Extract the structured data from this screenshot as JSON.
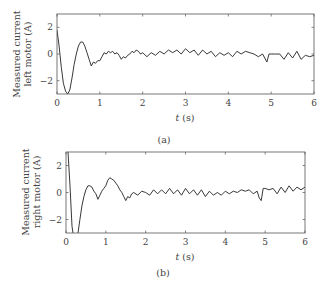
{
  "chart_data": [
    {
      "type": "line",
      "id": "a",
      "caption": "(a)",
      "title": "",
      "xlabel_italic": "t",
      "xlabel_unit": " (s)",
      "ylabel_lines": [
        "Measured current",
        "left motor (A)"
      ],
      "xlim": [
        0,
        6
      ],
      "ylim": [
        -3,
        3
      ],
      "xticks": [
        0,
        1,
        2,
        3,
        4,
        5,
        6
      ],
      "yticks": [
        -2,
        0,
        2
      ],
      "ytick_labels": [
        "−2",
        "0",
        "2"
      ],
      "grid": false,
      "series": [
        {
          "name": "left motor current",
          "color": "#222222",
          "x": [
            0,
            0.05,
            0.1,
            0.15,
            0.2,
            0.25,
            0.3,
            0.35,
            0.4,
            0.45,
            0.5,
            0.55,
            0.6,
            0.65,
            0.7,
            0.75,
            0.8,
            0.85,
            0.9,
            0.95,
            1.0,
            1.05,
            1.1,
            1.15,
            1.2,
            1.25,
            1.3,
            1.35,
            1.4,
            1.45,
            1.5,
            1.55,
            1.6,
            1.65,
            1.7,
            1.75,
            1.8,
            1.85,
            1.9,
            1.95,
            2.0,
            2.1,
            2.2,
            2.3,
            2.4,
            2.5,
            2.6,
            2.7,
            2.8,
            2.9,
            3.0,
            3.1,
            3.2,
            3.3,
            3.4,
            3.5,
            3.6,
            3.7,
            3.8,
            3.9,
            4.0,
            4.1,
            4.2,
            4.3,
            4.4,
            4.5,
            4.6,
            4.7,
            4.8,
            4.85,
            4.9,
            4.95,
            5.0,
            5.1,
            5.2,
            5.3,
            5.4,
            5.5,
            5.6,
            5.7,
            5.8,
            5.9,
            6.0
          ],
          "values": [
            1.8,
            0.6,
            -1.0,
            -2.2,
            -2.8,
            -3.0,
            -2.7,
            -1.8,
            -0.8,
            0.0,
            0.6,
            0.9,
            0.9,
            0.6,
            0.1,
            -0.4,
            -0.9,
            -0.6,
            -0.7,
            -0.5,
            -0.5,
            -0.2,
            0.1,
            0.0,
            0.2,
            0.1,
            0.2,
            0.0,
            0.1,
            -0.1,
            -0.4,
            -0.2,
            -0.3,
            -0.1,
            0.0,
            0.2,
            0.1,
            0.3,
            0.2,
            0.0,
            0.1,
            -0.2,
            0.1,
            -0.1,
            0.2,
            0.0,
            0.3,
            0.1,
            0.3,
            0.0,
            0.4,
            0.1,
            0.3,
            -0.1,
            0.3,
            0.0,
            0.2,
            -0.2,
            0.1,
            -0.1,
            0.1,
            -0.2,
            0.2,
            0.0,
            0.2,
            0.1,
            0.0,
            -0.2,
            0.0,
            -0.3,
            -0.6,
            0.0,
            0.0,
            0.0,
            0.0,
            -0.4,
            0.1,
            -0.3,
            0.2,
            -0.4,
            -0.1,
            -0.2,
            -0.1
          ]
        }
      ]
    },
    {
      "type": "line",
      "id": "b",
      "caption": "(b)",
      "title": "",
      "xlabel_italic": "t",
      "xlabel_unit": " (s)",
      "ylabel_lines": [
        "Measured current",
        "right motor (A)"
      ],
      "xlim": [
        0,
        6
      ],
      "ylim": [
        -3,
        3
      ],
      "xticks": [
        0,
        1,
        2,
        3,
        4,
        5,
        6
      ],
      "yticks": [
        -2,
        0,
        2
      ],
      "ytick_labels": [
        "−2",
        "0",
        "2"
      ],
      "grid": false,
      "series": [
        {
          "name": "right motor current",
          "color": "#222222",
          "x": [
            0.05,
            0.1,
            0.15,
            0.2,
            0.25,
            0.3,
            0.35,
            0.4,
            0.45,
            0.5,
            0.55,
            0.6,
            0.65,
            0.7,
            0.75,
            0.8,
            0.85,
            0.9,
            0.95,
            1.0,
            1.05,
            1.1,
            1.15,
            1.2,
            1.25,
            1.3,
            1.35,
            1.4,
            1.45,
            1.5,
            1.55,
            1.6,
            1.65,
            1.7,
            1.8,
            1.9,
            2.0,
            2.1,
            2.2,
            2.3,
            2.4,
            2.5,
            2.6,
            2.7,
            2.8,
            2.9,
            3.0,
            3.1,
            3.2,
            3.3,
            3.4,
            3.5,
            3.6,
            3.7,
            3.8,
            3.9,
            4.0,
            4.1,
            4.2,
            4.3,
            4.4,
            4.5,
            4.6,
            4.7,
            4.8,
            4.85,
            4.9,
            4.95,
            5.0,
            5.1,
            5.2,
            5.3,
            5.4,
            5.5,
            5.6,
            5.7,
            5.8,
            5.9,
            6.0
          ],
          "values": [
            3.0,
            0.5,
            -2.5,
            -3.5,
            -3.5,
            -3.0,
            -2.0,
            -1.0,
            -0.3,
            0.2,
            0.5,
            0.5,
            0.4,
            0.1,
            -0.1,
            -0.5,
            -0.2,
            0.1,
            0.3,
            0.5,
            0.9,
            1.1,
            1.0,
            0.9,
            0.7,
            0.5,
            0.2,
            0.0,
            -0.3,
            -0.6,
            -0.3,
            -0.4,
            -0.1,
            0.0,
            -0.2,
            0.1,
            0.0,
            -0.2,
            0.2,
            -0.1,
            0.2,
            -0.1,
            0.3,
            -0.1,
            0.2,
            -0.2,
            0.3,
            -0.1,
            0.2,
            -0.2,
            0.2,
            -0.3,
            0.1,
            -0.2,
            0.0,
            -0.2,
            0.1,
            -0.1,
            0.1,
            0.0,
            0.2,
            0.1,
            0.2,
            -0.1,
            0.1,
            -0.4,
            -0.6,
            0.3,
            0.3,
            0.2,
            0.3,
            -0.1,
            0.4,
            0.0,
            0.5,
            0.1,
            0.4,
            0.2,
            0.4
          ]
        }
      ]
    }
  ]
}
